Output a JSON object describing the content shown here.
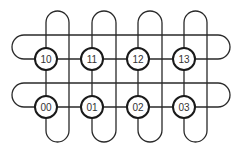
{
  "diagram": {
    "type": "2x4 torus network",
    "colors": {
      "stroke": "#2a2a2a",
      "node_stroke": "#1a1a1a",
      "node_fill": "#ffffff",
      "label": "#333333"
    },
    "columns_x": [
      46,
      92,
      138,
      184
    ],
    "column_return_x": [
      69,
      116,
      162,
      207
    ],
    "rows": [
      {
        "row": 1,
        "y": 59,
        "loop_top_y": 35,
        "nodes": [
          {
            "id": "10",
            "label": "10"
          },
          {
            "id": "11",
            "label": "11"
          },
          {
            "id": "12",
            "label": "12"
          },
          {
            "id": "13",
            "label": "13"
          }
        ]
      },
      {
        "row": 0,
        "y": 107,
        "loop_top_y": 83,
        "nodes": [
          {
            "id": "00",
            "label": "00"
          },
          {
            "id": "01",
            "label": "01"
          },
          {
            "id": "02",
            "label": "02"
          },
          {
            "id": "03",
            "label": "03"
          }
        ]
      }
    ],
    "row_loop_x": [
      12,
      230
    ],
    "col_loop_y": [
      11,
      142
    ],
    "node_radius": 11
  }
}
